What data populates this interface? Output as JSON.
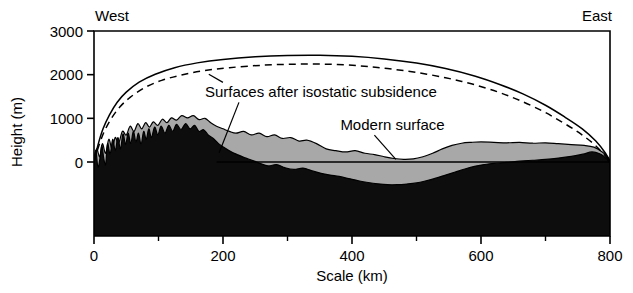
{
  "figure": {
    "direction_left": "West",
    "direction_right": "East",
    "y_axis_title": "Height (m)",
    "x_axis_title": "Scale (km)",
    "annotations": {
      "isostatic": "Surfaces after isostatic subsidence",
      "modern": "Modern surface"
    },
    "colors": {
      "basement": "#0d0d0d",
      "sediment": "#a8a8a8",
      "line": "#000000",
      "background": "#ffffff"
    }
  },
  "chart_data": {
    "type": "area",
    "title": "",
    "xlabel": "Scale (km)",
    "ylabel": "Height (m)",
    "xlim": [
      0,
      800
    ],
    "ylim": [
      -1100,
      3000
    ],
    "grid": false,
    "legend": "none",
    "x_ticks": [
      0,
      200,
      400,
      600,
      800
    ],
    "x_ticks_minor": [
      100,
      300,
      500,
      700
    ],
    "y_ticks": [
      0,
      1000,
      2000,
      3000
    ],
    "annotations": [
      {
        "text": "Surfaces after isostatic subsidence",
        "x_km": 172,
        "y_m": 1480,
        "leaders": [
          {
            "to_x_km": 178,
            "to_y_m": 2010
          },
          {
            "to_x_km": 194,
            "to_y_m": 210
          }
        ]
      },
      {
        "text": "Modern surface",
        "x_km": 382,
        "y_m": 730,
        "leaders": [
          {
            "to_x_km": 468,
            "to_y_m": 60
          }
        ]
      }
    ],
    "series": [
      {
        "name": "Surface after isostatic subsidence (upper, solid)",
        "style": "solid",
        "points": [
          [
            0,
            0
          ],
          [
            6,
            380
          ],
          [
            14,
            760
          ],
          [
            24,
            1080
          ],
          [
            36,
            1370
          ],
          [
            50,
            1600
          ],
          [
            70,
            1830
          ],
          [
            95,
            2010
          ],
          [
            125,
            2160
          ],
          [
            160,
            2270
          ],
          [
            200,
            2350
          ],
          [
            250,
            2410
          ],
          [
            300,
            2440
          ],
          [
            350,
            2445
          ],
          [
            400,
            2420
          ],
          [
            450,
            2360
          ],
          [
            500,
            2265
          ],
          [
            545,
            2140
          ],
          [
            590,
            1970
          ],
          [
            630,
            1770
          ],
          [
            665,
            1560
          ],
          [
            700,
            1300
          ],
          [
            730,
            1030
          ],
          [
            757,
            760
          ],
          [
            778,
            480
          ],
          [
            793,
            200
          ],
          [
            800,
            0
          ]
        ]
      },
      {
        "name": "Surface after isostatic subsidence (lower, dashed)",
        "style": "dashed",
        "points": [
          [
            0,
            0
          ],
          [
            7,
            350
          ],
          [
            16,
            700
          ],
          [
            27,
            1000
          ],
          [
            40,
            1260
          ],
          [
            56,
            1480
          ],
          [
            78,
            1700
          ],
          [
            105,
            1870
          ],
          [
            135,
            1990
          ],
          [
            170,
            2090
          ],
          [
            210,
            2160
          ],
          [
            260,
            2215
          ],
          [
            310,
            2240
          ],
          [
            360,
            2240
          ],
          [
            410,
            2205
          ],
          [
            455,
            2140
          ],
          [
            500,
            2050
          ],
          [
            545,
            1930
          ],
          [
            585,
            1790
          ],
          [
            625,
            1610
          ],
          [
            660,
            1410
          ],
          [
            695,
            1170
          ],
          [
            725,
            920
          ],
          [
            752,
            670
          ],
          [
            775,
            410
          ],
          [
            791,
            170
          ],
          [
            800,
            0
          ]
        ]
      },
      {
        "name": "Modern surface (top of sediment / topography)",
        "style": "filled-gray-top",
        "points": [
          [
            0,
            50
          ],
          [
            4,
            300
          ],
          [
            9,
            120
          ],
          [
            13,
            420
          ],
          [
            18,
            200
          ],
          [
            23,
            520
          ],
          [
            28,
            300
          ],
          [
            33,
            560
          ],
          [
            38,
            420
          ],
          [
            44,
            700
          ],
          [
            50,
            620
          ],
          [
            56,
            820
          ],
          [
            62,
            700
          ],
          [
            68,
            880
          ],
          [
            74,
            760
          ],
          [
            80,
            900
          ],
          [
            86,
            800
          ],
          [
            92,
            920
          ],
          [
            99,
            840
          ],
          [
            106,
            980
          ],
          [
            113,
            900
          ],
          [
            120,
            1010
          ],
          [
            128,
            960
          ],
          [
            136,
            1060
          ],
          [
            145,
            1010
          ],
          [
            154,
            1060
          ],
          [
            163,
            970
          ],
          [
            172,
            1000
          ],
          [
            181,
            900
          ],
          [
            190,
            820
          ],
          [
            200,
            760
          ],
          [
            210,
            700
          ],
          [
            220,
            660
          ],
          [
            232,
            700
          ],
          [
            244,
            620
          ],
          [
            256,
            660
          ],
          [
            268,
            580
          ],
          [
            280,
            620
          ],
          [
            292,
            540
          ],
          [
            305,
            560
          ],
          [
            318,
            480
          ],
          [
            330,
            500
          ],
          [
            345,
            420
          ],
          [
            360,
            300
          ],
          [
            375,
            260
          ],
          [
            390,
            230
          ],
          [
            405,
            260
          ],
          [
            420,
            200
          ],
          [
            435,
            170
          ],
          [
            450,
            120
          ],
          [
            465,
            80
          ],
          [
            480,
            60
          ],
          [
            495,
            70
          ],
          [
            510,
            120
          ],
          [
            525,
            200
          ],
          [
            540,
            300
          ],
          [
            555,
            380
          ],
          [
            570,
            430
          ],
          [
            585,
            450
          ],
          [
            600,
            460
          ],
          [
            620,
            450
          ],
          [
            640,
            440
          ],
          [
            660,
            450
          ],
          [
            680,
            430
          ],
          [
            700,
            440
          ],
          [
            720,
            420
          ],
          [
            740,
            400
          ],
          [
            760,
            380
          ],
          [
            775,
            340
          ],
          [
            788,
            230
          ],
          [
            796,
            120
          ],
          [
            800,
            40
          ]
        ]
      },
      {
        "name": "Basement top (black bedrock surface)",
        "style": "filled-black-top",
        "points": [
          [
            0,
            40
          ],
          [
            3,
            260
          ],
          [
            6,
            -120
          ],
          [
            9,
            60
          ],
          [
            12,
            380
          ],
          [
            15,
            100
          ],
          [
            18,
            -60
          ],
          [
            21,
            420
          ],
          [
            25,
            180
          ],
          [
            29,
            520
          ],
          [
            33,
            260
          ],
          [
            37,
            560
          ],
          [
            41,
            300
          ],
          [
            45,
            640
          ],
          [
            49,
            400
          ],
          [
            53,
            660
          ],
          [
            57,
            420
          ],
          [
            61,
            700
          ],
          [
            65,
            460
          ],
          [
            69,
            660
          ],
          [
            73,
            400
          ],
          [
            77,
            700
          ],
          [
            81,
            520
          ],
          [
            85,
            760
          ],
          [
            89,
            560
          ],
          [
            94,
            800
          ],
          [
            99,
            620
          ],
          [
            104,
            820
          ],
          [
            110,
            660
          ],
          [
            116,
            840
          ],
          [
            122,
            700
          ],
          [
            128,
            860
          ],
          [
            135,
            740
          ],
          [
            142,
            880
          ],
          [
            149,
            760
          ],
          [
            156,
            840
          ],
          [
            163,
            700
          ],
          [
            170,
            740
          ],
          [
            177,
            620
          ],
          [
            185,
            540
          ],
          [
            193,
            420
          ],
          [
            202,
            330
          ],
          [
            212,
            240
          ],
          [
            222,
            170
          ],
          [
            233,
            100
          ],
          [
            245,
            40
          ],
          [
            257,
            -30
          ],
          [
            270,
            -90
          ],
          [
            283,
            -60
          ],
          [
            296,
            -130
          ],
          [
            310,
            -170
          ],
          [
            324,
            -140
          ],
          [
            338,
            -200
          ],
          [
            352,
            -260
          ],
          [
            366,
            -300
          ],
          [
            380,
            -330
          ],
          [
            395,
            -380
          ],
          [
            410,
            -430
          ],
          [
            425,
            -470
          ],
          [
            440,
            -500
          ],
          [
            455,
            -520
          ],
          [
            470,
            -520
          ],
          [
            485,
            -505
          ],
          [
            500,
            -480
          ],
          [
            515,
            -430
          ],
          [
            530,
            -370
          ],
          [
            545,
            -300
          ],
          [
            560,
            -230
          ],
          [
            575,
            -160
          ],
          [
            590,
            -100
          ],
          [
            605,
            -60
          ],
          [
            620,
            -30
          ],
          [
            640,
            -10
          ],
          [
            660,
            20
          ],
          [
            680,
            40
          ],
          [
            700,
            60
          ],
          [
            720,
            90
          ],
          [
            740,
            130
          ],
          [
            758,
            180
          ],
          [
            772,
            230
          ],
          [
            784,
            190
          ],
          [
            792,
            110
          ],
          [
            797,
            40
          ],
          [
            800,
            0
          ]
        ]
      },
      {
        "name": "Sea level reference line",
        "style": "horizontal-line",
        "y_m": 0,
        "x_range": [
          190,
          800
        ]
      }
    ]
  }
}
